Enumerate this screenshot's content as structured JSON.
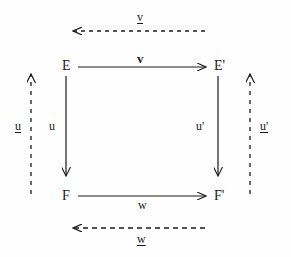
{
  "figure": {
    "kind": "commutative-diagram",
    "ink_color": "#1a1a1a",
    "background_color": "#fefefe"
  },
  "nodes": {
    "top_left": "E",
    "top_right": "E'",
    "bottom_left": "F",
    "bottom_right": "F'"
  },
  "solid_arrows": {
    "top": {
      "label": "v",
      "from": "E",
      "to": "E'",
      "direction": "right",
      "style": "bold"
    },
    "left": {
      "label": "u",
      "from": "E",
      "to": "F",
      "direction": "down",
      "style": "plain"
    },
    "right": {
      "label": "u'",
      "from": "E'",
      "to": "F'",
      "direction": "down",
      "style": "plain"
    },
    "bottom": {
      "label": "w",
      "from": "F",
      "to": "F'",
      "direction": "right",
      "style": "plain"
    }
  },
  "dashed_arrows": {
    "top": {
      "label": "v",
      "direction": "left",
      "style": "underlined"
    },
    "left": {
      "label": "u",
      "direction": "up",
      "style": "underlined"
    },
    "right": {
      "label": "u'",
      "direction": "up",
      "style": "underlined"
    },
    "bottom": {
      "label": "w",
      "direction": "left",
      "style": "underlined"
    }
  }
}
